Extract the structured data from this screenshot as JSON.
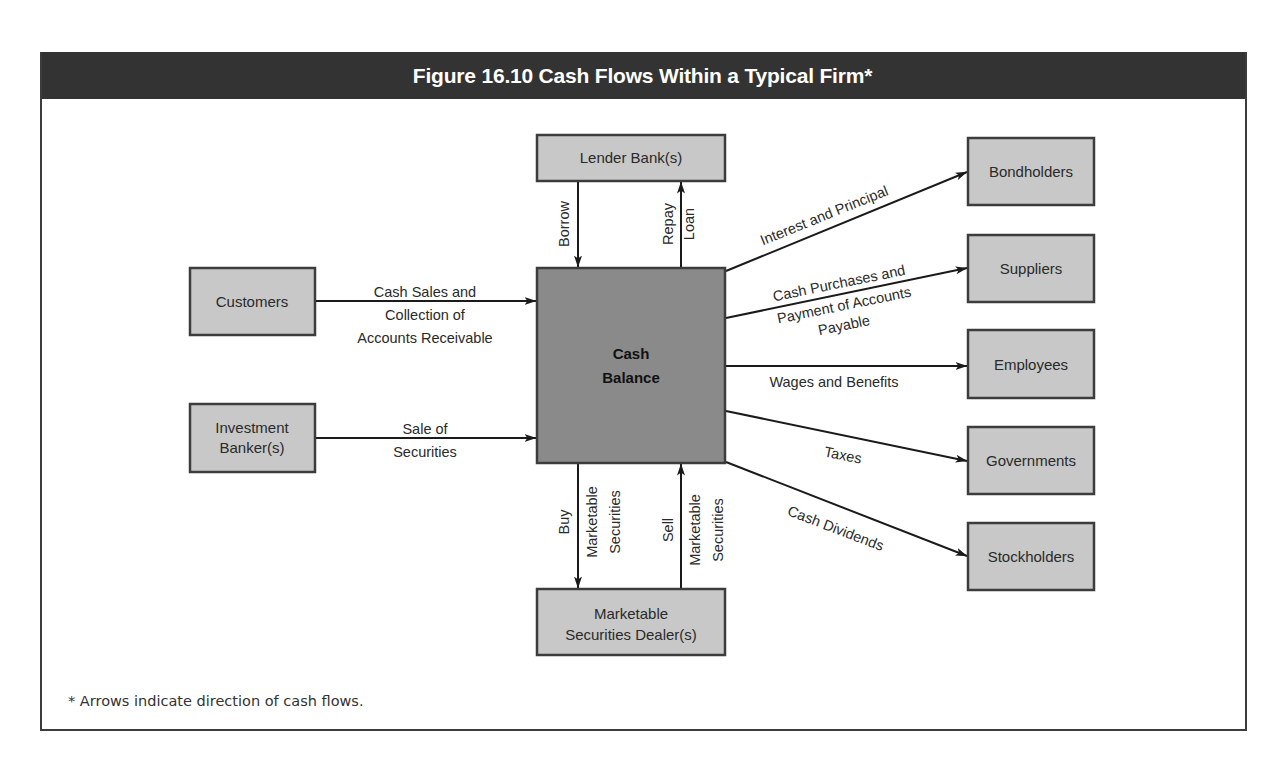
{
  "figure": {
    "title": "Figure 16.10  Cash Flows Within a Typical Firm*",
    "footnote": "* Arrows indicate direction of cash flows.",
    "colors": {
      "header_bg": "#333333",
      "header_text": "#ffffff",
      "box_fill": "#c8c8c8",
      "center_fill": "#8a8a8a",
      "stroke": "#3c3c3c"
    }
  },
  "nodes": {
    "center": {
      "line1": "Cash",
      "line2": "Balance"
    },
    "lender": {
      "label": "Lender Bank(s)"
    },
    "customers": {
      "label": "Customers"
    },
    "investment": {
      "line1": "Investment",
      "line2": "Banker(s)"
    },
    "dealer": {
      "line1": "Marketable",
      "line2": "Securities Dealer(s)"
    },
    "bondholders": {
      "label": "Bondholders"
    },
    "suppliers": {
      "label": "Suppliers"
    },
    "employees": {
      "label": "Employees"
    },
    "governments": {
      "label": "Governments"
    },
    "stockholders": {
      "label": "Stockholders"
    }
  },
  "flows": {
    "customers": {
      "line1": "Cash Sales and",
      "line2": "Collection of",
      "line3": "Accounts Receivable"
    },
    "investment": {
      "line1": "Sale of",
      "line2": "Securities"
    },
    "borrow": {
      "label": "Borrow"
    },
    "repay": {
      "line1": "Repay",
      "line2": "Loan"
    },
    "buy": {
      "line1": "Buy",
      "line2": "Marketable",
      "line3": "Securities"
    },
    "sell": {
      "line1": "Sell",
      "line2": "Marketable",
      "line3": "Securities"
    },
    "bondholders": {
      "label": "Interest and Principal"
    },
    "suppliers": {
      "line1": "Cash Purchases and",
      "line2": "Payment of Accounts",
      "line3": "Payable"
    },
    "employees": {
      "label": "Wages and Benefits"
    },
    "governments": {
      "label": "Taxes"
    },
    "stockholders": {
      "label": "Cash Dividends"
    }
  }
}
